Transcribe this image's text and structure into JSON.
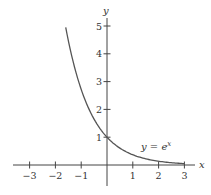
{
  "chart_data": {
    "type": "line",
    "title": "",
    "xlabel": "x",
    "ylabel": "y",
    "xlim": [
      -3.6,
      3.6
    ],
    "ylim": [
      -0.7,
      5.5
    ],
    "grid": false,
    "x_ticks": [
      -3,
      -2,
      -1,
      1,
      2,
      3
    ],
    "x_tick_labels": [
      "−3",
      "−2",
      "−1",
      "1",
      "2",
      "3"
    ],
    "y_ticks": [
      1,
      2,
      3,
      4,
      5
    ],
    "y_tick_labels": [
      "1",
      "2",
      "3",
      "4",
      "5"
    ],
    "series": [
      {
        "name": "y = e^x",
        "function": "exp(-x)",
        "x_range": [
          -1.6,
          3
        ],
        "points": [
          [
            -1.6,
            4.95
          ],
          [
            -1.4,
            4.06
          ],
          [
            -1.2,
            3.32
          ],
          [
            -1.0,
            2.72
          ],
          [
            -0.8,
            2.23
          ],
          [
            -0.6,
            1.82
          ],
          [
            -0.4,
            1.49
          ],
          [
            -0.2,
            1.22
          ],
          [
            0,
            1.0
          ],
          [
            0.25,
            0.78
          ],
          [
            0.5,
            0.61
          ],
          [
            0.75,
            0.47
          ],
          [
            1.0,
            0.37
          ],
          [
            1.25,
            0.29
          ],
          [
            1.5,
            0.22
          ],
          [
            1.75,
            0.17
          ],
          [
            2.0,
            0.14
          ],
          [
            2.25,
            0.11
          ],
          [
            2.5,
            0.08
          ],
          [
            2.75,
            0.06
          ],
          [
            3.0,
            0.05
          ]
        ],
        "color": "#555555"
      }
    ],
    "annotations": [
      {
        "text": "y = e",
        "superscript": "x",
        "at": [
          1.3,
          0.7
        ]
      }
    ],
    "legend": null
  },
  "labels": {
    "x_axis": "x",
    "y_axis": "y",
    "curve_label_base": "y = e",
    "curve_label_sup": "x"
  }
}
